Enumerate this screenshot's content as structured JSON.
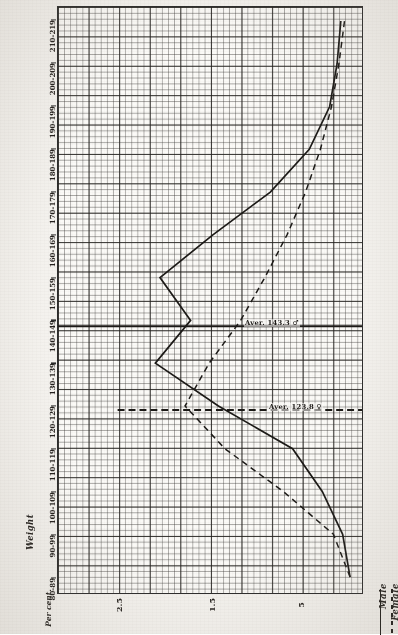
{
  "chart_title_vertical": "Laboratory  Units",
  "axes": {
    "y_axis_label": "Weight",
    "x_axis_label": "Per cent.",
    "y_tick_labels": [
      "210-219",
      "200-209",
      "190-199",
      "180-189",
      "170-179",
      "160-169",
      "150-159",
      "140-149",
      "130-139",
      "120-129",
      "110-119",
      "100-109",
      "90-99",
      "80-89"
    ],
    "x_tick_labels": [
      "2.5",
      "1.5",
      "5"
    ]
  },
  "legend": {
    "items": [
      {
        "label": "Male",
        "style": "solid"
      },
      {
        "label": "Female",
        "style": "dashed"
      }
    ]
  },
  "annotations": [
    {
      "text": "Aver. 143.3  ♂",
      "series": "male"
    },
    {
      "text": "Aver. 123.8  ♀",
      "series": "female"
    }
  ],
  "colors": {
    "ink": "#1c1a17",
    "grid_fine": "#5d5a55",
    "grid_bold": "#232120",
    "paper": "#fbfaf7"
  },
  "chart_data": {
    "type": "line",
    "title": "Laboratory Units",
    "subtitle": "",
    "xlabel": "Per cent.",
    "ylabel": "Weight",
    "orientation": "horizontal-bands",
    "grid": true,
    "legend_position": "bottom-right",
    "categories": [
      "80-89",
      "90-99",
      "100-109",
      "110-119",
      "120-129",
      "130-139",
      "140-149",
      "150-159",
      "160-169",
      "170-179",
      "180-189",
      "190-199",
      "200-209",
      "210-219"
    ],
    "xlim": [
      0,
      3.0
    ],
    "x_major_ticks": [
      2.5,
      1.5,
      0.5
    ],
    "series": [
      {
        "name": "Male",
        "style": "solid",
        "values": [
          0.0,
          0.08,
          0.3,
          0.62,
          1.42,
          2.1,
          1.72,
          2.05,
          1.48,
          0.86,
          0.44,
          0.22,
          0.14,
          0.1
        ]
      },
      {
        "name": "Female",
        "style": "dashed",
        "values": [
          0.0,
          0.18,
          0.72,
          1.35,
          1.78,
          1.52,
          1.18,
          0.92,
          0.68,
          0.48,
          0.32,
          0.2,
          0.12,
          0.06
        ]
      }
    ],
    "reference_lines": [
      {
        "label": "Aver. 143.3 ♂",
        "category": "140-149",
        "style": "solid"
      },
      {
        "label": "Aver. 123.8 ♀",
        "category": "120-129",
        "style": "dashed"
      }
    ]
  }
}
